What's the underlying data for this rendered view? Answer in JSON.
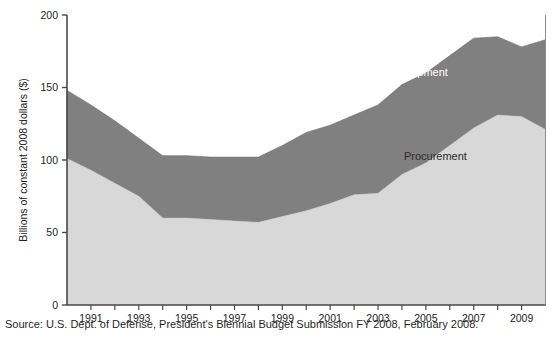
{
  "chart_data": {
    "type": "area",
    "stacked": true,
    "title": "",
    "subtitle": "",
    "xlabel": "",
    "ylabel": "Billions of constant 2008 dollars ($)",
    "xlim": [
      1990,
      2010
    ],
    "ylim": [
      0,
      200
    ],
    "yticks": [
      0,
      50,
      100,
      150,
      200
    ],
    "ytick_labels": [
      "0",
      "50",
      "100",
      "150",
      "200"
    ],
    "xticks": [
      1991,
      1993,
      1995,
      1997,
      1999,
      2001,
      2003,
      2005,
      2007,
      2009
    ],
    "xtick_labels": [
      "1991",
      "1993",
      "1995",
      "1997",
      "1999",
      "2001",
      "2003",
      "2005",
      "2007",
      "2009"
    ],
    "x": [
      1990,
      1991,
      1992,
      1993,
      1994,
      1995,
      1996,
      1997,
      1998,
      1999,
      2000,
      2001,
      2002,
      2003,
      2004,
      2005,
      2006,
      2007,
      2008,
      2009,
      2010
    ],
    "grid": false,
    "legend_position": "inline-annotations",
    "series": [
      {
        "name": "Procurement",
        "color": "#d8d8d8",
        "label_color": "#2b2b2b",
        "values": [
          101,
          93,
          84,
          75,
          60,
          60,
          59,
          58,
          57,
          61,
          65,
          70,
          76,
          77,
          90,
          98,
          110,
          122,
          131,
          130,
          121
        ]
      },
      {
        "name": "Research & Development",
        "color": "#808080",
        "label_color": "#ffffff",
        "values": [
          47,
          45,
          43,
          40,
          43,
          43,
          43,
          44,
          45,
          49,
          54,
          54,
          55,
          61,
          62,
          62,
          62,
          62,
          54,
          48,
          62
        ]
      }
    ],
    "totals": [
      148,
      138,
      127,
      115,
      103,
      103,
      102,
      102,
      102,
      110,
      119,
      124,
      131,
      138,
      152,
      160,
      172,
      184,
      185,
      178,
      183
    ],
    "annotations": [
      {
        "text": "Research & Development",
        "x": 2003.3,
        "y": 158,
        "color": "#ffffff"
      },
      {
        "text": "Procurement",
        "x": 2005.4,
        "y": 100,
        "color": "#2b2b2b"
      }
    ]
  },
  "axes": {
    "y_axis_title": "Billions of constant 2008 dollars ($)",
    "y_tick_labels": [
      "200",
      "150",
      "100",
      "50",
      "0"
    ],
    "x_tick_labels": [
      "1991",
      "1993",
      "1995",
      "1997",
      "1999",
      "2001",
      "2003",
      "2005",
      "2007",
      "2009"
    ]
  },
  "labels": {
    "rnd": "Research & Development",
    "procurement": "Procurement"
  },
  "source": {
    "text": "Source: U.S. Dept. of Defense, President's Biennial Budget Submission FY 2008, February 2008."
  },
  "colors": {
    "procurement_fill": "#d8d8d8",
    "rnd_fill": "#808080",
    "axis": "#4a4a4a",
    "text": "#1f1f1f"
  }
}
